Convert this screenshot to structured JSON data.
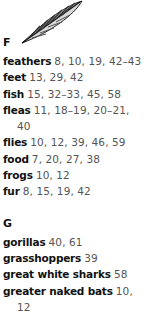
{
  "illustration": {
    "icon": "feather-icon"
  },
  "sections": [
    {
      "letter": "F",
      "entries": [
        {
          "term": "feathers",
          "pages": "8, 10, 19, 42–43"
        },
        {
          "term": "feet",
          "pages": "13, 29, 42"
        },
        {
          "term": "fish",
          "pages": "15, 32–33, 45, 58"
        },
        {
          "term": "fleas",
          "pages": "11, 18–19, 20–21, 40"
        },
        {
          "term": "flies",
          "pages": "10, 12, 39, 46, 59"
        },
        {
          "term": "food",
          "pages": "7, 20, 27, 38"
        },
        {
          "term": "frogs",
          "pages": "10, 12"
        },
        {
          "term": "fur",
          "pages": "8, 15, 19, 42"
        }
      ]
    },
    {
      "letter": "G",
      "entries": [
        {
          "term": "gorillas",
          "pages": "40, 61"
        },
        {
          "term": "grasshoppers",
          "pages": "39"
        },
        {
          "term": "great white sharks",
          "pages": "58"
        },
        {
          "term": "greater naked bats",
          "pages": "10, 12"
        }
      ]
    }
  ]
}
